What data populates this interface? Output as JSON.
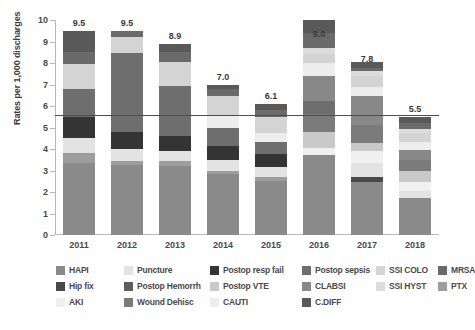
{
  "chart_data": {
    "type": "bar",
    "stacked": true,
    "title": "",
    "subtitle": "",
    "xlabel": "",
    "ylabel": "Rates per 1,000 discharges",
    "categories": [
      "2011",
      "2012",
      "2013",
      "2014",
      "2015",
      "2016",
      "2017",
      "2018"
    ],
    "ylim": [
      0,
      10
    ],
    "yticks": [
      0,
      1,
      2,
      3,
      4,
      5,
      6,
      7,
      8,
      9,
      10
    ],
    "grid": false,
    "legend_position": "bottom",
    "totals": [
      9.5,
      9.5,
      8.9,
      7.0,
      6.1,
      9.0,
      7.8,
      5.5
    ],
    "total_labels": [
      "9.5",
      "9.5",
      "8.9",
      "7.0",
      "6.1",
      "9.0",
      "7.8",
      "5.5"
    ],
    "reference_line": {
      "value": 5.6,
      "label": ""
    },
    "series": [
      {
        "name": "HAPI",
        "color": "#8a8a8a",
        "values": [
          3.35,
          3.25,
          3.2,
          2.85,
          2.5,
          3.7,
          2.45,
          1.7
        ]
      },
      {
        "name": "Hip fix",
        "color": "#4a4a4a",
        "values": [
          0.0,
          0.0,
          0.0,
          0.0,
          0.0,
          0.0,
          0.25,
          0.0
        ]
      },
      {
        "name": "PTX",
        "color": "#9d9d9d",
        "values": [
          0.45,
          0.2,
          0.25,
          0.15,
          0.2,
          0.0,
          0.0,
          0.0
        ]
      },
      {
        "name": "Puncture",
        "color": "#e3e3e3",
        "values": [
          0.7,
          0.55,
          0.45,
          0.5,
          0.45,
          0.0,
          0.65,
          0.35
        ]
      },
      {
        "name": "Postop Hemorrh",
        "color": "#5e5e5e",
        "values": [
          0.0,
          0.0,
          0.0,
          0.0,
          0.0,
          0.0,
          0.0,
          0.0
        ]
      },
      {
        "name": "AKI",
        "color": "#f0f0f0",
        "values": [
          0.0,
          0.0,
          0.0,
          0.0,
          0.0,
          0.35,
          0.55,
          0.4
        ]
      },
      {
        "name": "Postop resp fail",
        "color": "#343434",
        "values": [
          1.0,
          0.8,
          0.7,
          0.65,
          0.6,
          0.0,
          0.0,
          0.0
        ]
      },
      {
        "name": "Postop VTE",
        "color": "#c9c9c9",
        "values": [
          0.0,
          0.0,
          0.0,
          0.0,
          0.0,
          0.75,
          0.4,
          0.55
        ]
      },
      {
        "name": "Wound Dehisc",
        "color": "#7b7b7b",
        "values": [
          0.0,
          0.0,
          0.0,
          0.0,
          0.0,
          0.85,
          0.8,
          0.5
        ]
      },
      {
        "name": "Postop sepsis",
        "color": "#6e6e6e",
        "values": [
          1.3,
          3.65,
          2.35,
          0.85,
          0.6,
          0.6,
          0.0,
          0.0
        ]
      },
      {
        "name": "CLABSI",
        "color": "#888888",
        "values": [
          0.0,
          0.0,
          0.0,
          0.0,
          0.0,
          1.15,
          1.35,
          0.45
        ]
      },
      {
        "name": "CAUTI",
        "color": "#ededed",
        "values": [
          0.0,
          0.0,
          0.0,
          0.6,
          0.4,
          0.6,
          0.45,
          0.4
        ]
      },
      {
        "name": "SSI COLO",
        "color": "#d4d4d4",
        "values": [
          1.15,
          0.75,
          1.1,
          0.85,
          0.75,
          0.4,
          0.5,
          0.4
        ]
      },
      {
        "name": "SSI HYST",
        "color": "#dcdcdc",
        "values": [
          0.0,
          0.0,
          0.0,
          0.0,
          0.0,
          0.3,
          0.25,
          0.2
        ]
      },
      {
        "name": "MRSA",
        "color": "#6a6a6a",
        "values": [
          0.55,
          0.3,
          0.45,
          0.35,
          0.3,
          0.7,
          0.1,
          0.25
        ]
      },
      {
        "name": "C.DIFF",
        "color": "#595959",
        "values": [
          1.0,
          0.0,
          0.4,
          0.2,
          0.3,
          0.6,
          0.3,
          0.3
        ]
      }
    ]
  },
  "legend": {
    "rows": [
      [
        {
          "label": "HAPI",
          "color": "#8a8a8a"
        },
        {
          "label": "Puncture",
          "color": "#e3e3e3"
        },
        {
          "label": "Postop resp fail",
          "color": "#343434"
        },
        {
          "label": "Postop sepsis",
          "color": "#6e6e6e"
        },
        {
          "label": "SSI COLO",
          "color": "#d4d4d4"
        },
        {
          "label": "MRSA",
          "color": "#6a6a6a"
        }
      ],
      [
        {
          "label": "Hip fix",
          "color": "#4a4a4a"
        },
        {
          "label": "Postop Hemorrh",
          "color": "#5e5e5e"
        },
        {
          "label": "Postop VTE",
          "color": "#c9c9c9"
        },
        {
          "label": "CLABSI",
          "color": "#888888"
        },
        {
          "label": "SSI HYST",
          "color": "#dcdcdc"
        }
      ],
      [
        {
          "label": "PTX",
          "color": "#9d9d9d"
        },
        {
          "label": "AKI",
          "color": "#f0f0f0"
        },
        {
          "label": "Wound Dehisc",
          "color": "#7b7b7b"
        },
        {
          "label": "CAUTI",
          "color": "#ededed"
        },
        {
          "label": "C.DIFF",
          "color": "#595959"
        }
      ]
    ]
  },
  "axis": {
    "y_title": "Rates per 1,000 discharges",
    "y_ticks": [
      "10",
      "9",
      "8",
      "7",
      "6",
      "5",
      "4",
      "3",
      "2",
      "1",
      "0"
    ],
    "x_ticks": [
      "2011",
      "2012",
      "2013",
      "2014",
      "2015",
      "2016",
      "2017",
      "2018"
    ]
  }
}
